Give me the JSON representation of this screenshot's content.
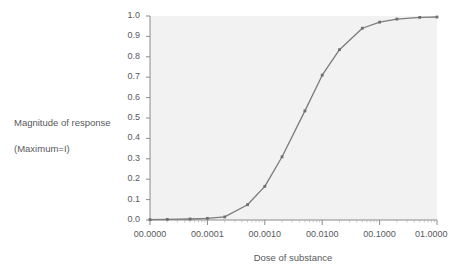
{
  "axis": {
    "y_title_line1": "Magnitude of response",
    "y_title_line2": "(Maximum=I)",
    "x_title": "Dose of substance",
    "y_ticks": [
      "1.0",
      "0.9",
      "0.8",
      "0.7",
      "0.6",
      "0.5",
      "0.4",
      "0.3",
      "0.2",
      "0.1",
      "0.0"
    ],
    "x_ticks": [
      "00.0000",
      "00.0001",
      "00.0010",
      "00.0100",
      "00.1000",
      "01.0000"
    ]
  },
  "colors": {
    "plot_background": "#f2f2f2",
    "line": "#7b7b7b",
    "marker": "#6e6e6e",
    "axis": "#8a8a8a",
    "grid": "#eaeaea",
    "text": "#58595b"
  },
  "chart_data": {
    "type": "line",
    "title": "",
    "xlabel": "Dose of substance",
    "ylabel": "Magnitude of response (Maximum=I)",
    "xscale": "log",
    "xlim": [
      1e-05,
      1.0
    ],
    "ylim": [
      0.0,
      1.0
    ],
    "grid": false,
    "legend": "none",
    "x_tick_labels": [
      "00.0000",
      "00.0001",
      "00.0010",
      "00.0100",
      "00.1000",
      "01.0000"
    ],
    "x_tick_values": [
      1e-05,
      0.0001,
      0.001,
      0.01,
      0.1,
      1.0
    ],
    "y_tick_values": [
      0.0,
      0.1,
      0.2,
      0.3,
      0.4,
      0.5,
      0.6,
      0.7,
      0.8,
      0.9,
      1.0
    ],
    "series": [
      {
        "name": "dose-response",
        "x": [
          1e-05,
          2e-05,
          5e-05,
          0.0001,
          0.0002,
          0.0005,
          0.001,
          0.002,
          0.005,
          0.01,
          0.02,
          0.05,
          0.1,
          0.2,
          0.5,
          1.0
        ],
        "y": [
          0.002,
          0.003,
          0.005,
          0.008,
          0.015,
          0.075,
          0.165,
          0.31,
          0.535,
          0.71,
          0.835,
          0.94,
          0.97,
          0.985,
          0.993,
          0.995
        ]
      }
    ]
  }
}
